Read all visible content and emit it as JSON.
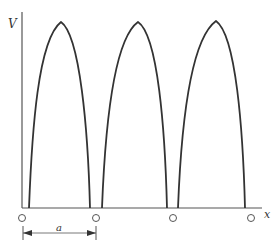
{
  "diagram": {
    "y_axis_label": "V",
    "x_axis_label": "x",
    "spacing_label": "a",
    "arch_count": 3,
    "node_count": 4,
    "colors": {
      "stroke": "#333333",
      "background": "#ffffff"
    }
  }
}
